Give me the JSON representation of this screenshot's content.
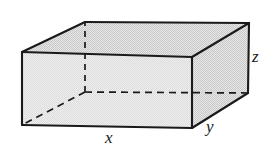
{
  "figure": {
    "name": "rectangular-box-diagram",
    "background_color": "#ffffff",
    "line_color": "#1a1a1a",
    "top_face_fill": "#d6d6d6",
    "right_face_fill": "#d9d9d9",
    "front_face_fill": "#e2e2e2",
    "hidden_edge_style": "dashed"
  },
  "labels": {
    "x": "x",
    "y": "y",
    "z": "z"
  },
  "geometry": {
    "vertices": {
      "front_top_left": [
        22,
        52
      ],
      "front_top_right": [
        192,
        57
      ],
      "front_bottom_left": [
        22,
        125
      ],
      "front_bottom_right": [
        192,
        128
      ],
      "back_top_left": [
        85,
        22
      ],
      "back_top_right": [
        249,
        23
      ],
      "back_bottom_left": [
        85,
        92
      ],
      "back_bottom_right": [
        248,
        93
      ]
    },
    "visible_edges": [
      "front_top_left-front_top_right",
      "front_top_left-front_bottom_left",
      "front_bottom_left-front_bottom_right",
      "front_top_right-front_bottom_right",
      "front_top_left-back_top_left",
      "front_top_right-back_top_right",
      "back_top_left-back_top_right",
      "back_top_right-back_bottom_right",
      "front_bottom_right-back_bottom_right"
    ],
    "hidden_edges": [
      "back_bottom_left-back_bottom_right",
      "back_bottom_left-back_top_left",
      "back_bottom_left-front_bottom_left"
    ]
  }
}
